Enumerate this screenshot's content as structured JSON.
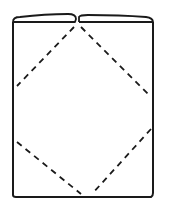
{
  "diagram": {
    "type": "line-drawing",
    "stroke_color": "#1a1a1a",
    "background": "#ffffff",
    "shapes": {
      "body_rect": {
        "x": 13,
        "y": 21,
        "width": 140,
        "height": 176
      },
      "top_flaps": [
        {
          "side": "left",
          "from_x": 13,
          "to_x": 76
        },
        {
          "side": "right",
          "from_x": 79,
          "to_x": 153
        }
      ],
      "dashed_fold_lines": [
        {
          "name": "upper-left",
          "x1": 74,
          "y1": 26,
          "x2": 17,
          "y2": 86
        },
        {
          "name": "upper-right",
          "x1": 81,
          "y1": 26,
          "x2": 151,
          "y2": 97
        },
        {
          "name": "lower-left",
          "x1": 17,
          "y1": 142,
          "x2": 81,
          "y2": 194
        },
        {
          "name": "lower-right",
          "x1": 151,
          "y1": 129,
          "x2": 92,
          "y2": 194
        }
      ]
    }
  }
}
